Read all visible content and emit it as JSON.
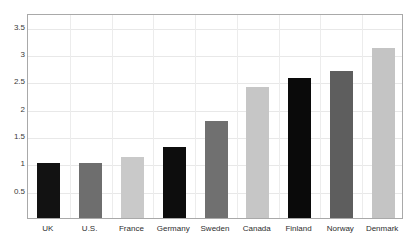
{
  "chart_data": {
    "type": "bar",
    "title": "",
    "subtitle": "",
    "xlabel": "",
    "ylabel": "",
    "categories": [
      "UK",
      "U.S.",
      "France",
      "Germany",
      "Sweden",
      "Canada",
      "Finland",
      "Norway",
      "Denmark"
    ],
    "values": [
      1.0,
      1.0,
      1.12,
      1.3,
      1.77,
      2.39,
      2.56,
      2.69,
      3.11
    ],
    "bar_colors": [
      "#121212",
      "#6e6e6e",
      "#c9c9c9",
      "#0d0d0d",
      "#707070",
      "#c6c6c6",
      "#0a0a0a",
      "#5e5e5e",
      "#c4c4c4"
    ],
    "ylim": [
      0,
      3.75
    ],
    "yticks": [
      0.5,
      1,
      1.5,
      2,
      2.5,
      3,
      3.5
    ],
    "ytick_labels": [
      "0.5",
      "1",
      "1.5",
      "2",
      "2.5",
      "3",
      "3.5"
    ],
    "grid": true,
    "grid_vertical": true,
    "legend": null,
    "legend_position": "none",
    "annotations": [],
    "axis_color": "#a9a9a9",
    "grid_color": "#e8e8e8",
    "background": "#ffffff"
  }
}
